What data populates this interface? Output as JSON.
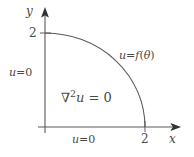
{
  "figure": {
    "type": "quarter-disk-boundary-value-problem",
    "stroke_color": "#5a5a5a",
    "text_color": "#4a4a4a",
    "background": "#ffffff"
  },
  "axes": {
    "y_label": "y",
    "x_label": "x",
    "y_tick_label": "2",
    "x_tick_label": "2"
  },
  "labels": {
    "left_boundary": {
      "var": "u",
      "op": "=",
      "value": "0"
    },
    "bottom_boundary": {
      "var": "u",
      "op": "=",
      "value": "0"
    },
    "arc_boundary": {
      "var": "u",
      "op": "=",
      "fn": "f",
      "open": "(",
      "arg": "θ",
      "close": ")"
    },
    "pde": {
      "nabla": "∇",
      "power": "2",
      "var": "u",
      "op": "=",
      "value": "0"
    }
  },
  "geometry": {
    "origin_x": 45,
    "origin_y": 127,
    "radius_x": 100,
    "radius_y": 94,
    "y_axis_tip": 8,
    "x_axis_tip": 180,
    "arc_top_x": 45,
    "arc_top_y": 33,
    "arc_right_x": 145,
    "arc_right_y": 127
  }
}
